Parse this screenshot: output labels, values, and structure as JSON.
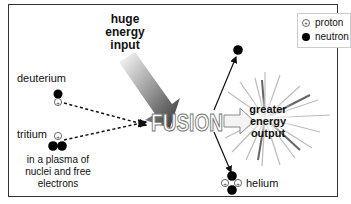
{
  "diagram": {
    "labels": {
      "energy_input": "huge\nenergy\ninput",
      "deuterium": "deuterium",
      "tritium": "tritium",
      "plasma_note": "in a plasma of\nnuclei and free\nelectrons",
      "fusion": "FUSION",
      "energy_output": "greater\nenergy\noutput",
      "helium": "helium"
    },
    "legend": {
      "items": [
        {
          "symbol": "proton",
          "label": "proton"
        },
        {
          "symbol": "neutron",
          "label": "neutron"
        }
      ]
    },
    "nodes": [
      {
        "id": "deuterium",
        "protons": 1,
        "neutrons": 1
      },
      {
        "id": "tritium",
        "protons": 1,
        "neutrons": 2
      },
      {
        "id": "helium",
        "protons": 2,
        "neutrons": 2
      },
      {
        "id": "free-neutron",
        "protons": 0,
        "neutrons": 1
      }
    ],
    "edges": [
      {
        "from": "deuterium",
        "to": "fusion",
        "style": "dashed"
      },
      {
        "from": "tritium",
        "to": "fusion",
        "style": "dashed"
      },
      {
        "from": "fusion",
        "to": "free-neutron",
        "style": "solid"
      },
      {
        "from": "fusion",
        "to": "helium",
        "style": "solid"
      },
      {
        "from": "fusion",
        "to": "energy-output",
        "style": "block-arrow"
      },
      {
        "from": "energy-input",
        "to": "fusion",
        "style": "gradient-arrow"
      }
    ]
  }
}
